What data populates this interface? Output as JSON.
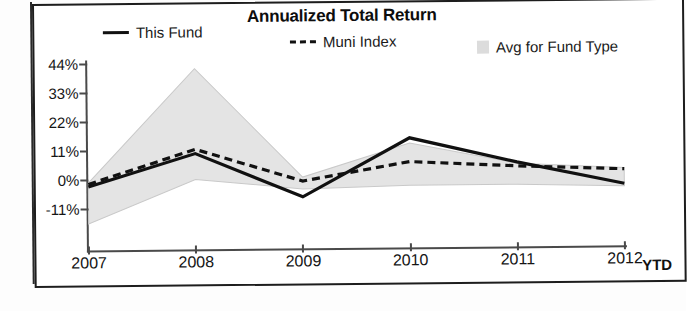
{
  "chart_data": {
    "type": "line",
    "title": "Annualized Total Return",
    "xlabel": "",
    "ylabel": "",
    "grid": false,
    "legend_position": "top",
    "categories": [
      "2007",
      "2008",
      "2009",
      "2010",
      "2011",
      "2012"
    ],
    "x_suffix_label": "YTD",
    "ytick_labels": [
      "44%",
      "33%",
      "22%",
      "11%",
      "0%",
      "-11%"
    ],
    "ytick_values": [
      44,
      33,
      22,
      11,
      0,
      -11
    ],
    "ylim": [
      -18,
      46
    ],
    "series": [
      {
        "name": "This Fund",
        "style": "solid",
        "color": "#111111",
        "values": [
          -2.5,
          9.8,
          -7.0,
          15.0,
          5.5,
          -3.0
        ]
      },
      {
        "name": "Muni Index",
        "style": "dashed",
        "color": "#111111",
        "values": [
          -1.5,
          11.4,
          -1.0,
          6.0,
          4.0,
          2.5
        ]
      },
      {
        "name": "Avg for Fund Type",
        "style": "band",
        "color": "#e2e2e2",
        "band_upper": [
          -1.0,
          42.0,
          0.5,
          13.0,
          5.0,
          3.0
        ],
        "band_lower": [
          -16.5,
          0.0,
          -4.0,
          -3.0,
          -3.0,
          -4.0
        ]
      }
    ],
    "legend": [
      {
        "label": "This Fund",
        "marker": "solid-line"
      },
      {
        "label": "Muni Index",
        "marker": "dashed-line"
      },
      {
        "label": "Avg for Fund Type",
        "marker": "filled-square"
      }
    ],
    "colors": {
      "line": "#111111",
      "band_fill": "#e4e4e4",
      "band_edge": "#c9c9c9",
      "axis": "#4a4a4a",
      "frame": "#1d1d1d"
    }
  }
}
